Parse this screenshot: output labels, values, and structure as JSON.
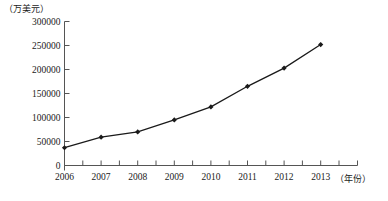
{
  "chart_data": {
    "type": "line",
    "title": "",
    "xlabel": "(年份)",
    "ylabel": "(万美元)",
    "categories": [
      "2006",
      "2007",
      "2008",
      "2009",
      "2010",
      "2011",
      "2012",
      "2013"
    ],
    "values": [
      37000,
      59000,
      70000,
      95000,
      122000,
      165000,
      203000,
      252000
    ],
    "series": [
      {
        "name": "",
        "values": [
          37000,
          59000,
          70000,
          95000,
          122000,
          165000,
          203000,
          252000
        ]
      }
    ],
    "ylim": [
      0,
      300000
    ],
    "ytick_labels": [
      "0",
      "50000",
      "100000",
      "150000",
      "200000",
      "250000",
      "300000"
    ],
    "ytick_values": [
      0,
      50000,
      100000,
      150000,
      200000,
      250000,
      300000
    ],
    "xtick_labels": [
      "2006",
      "2007",
      "2008",
      "2009",
      "2010",
      "2011",
      "2012",
      "2013"
    ],
    "grid": false,
    "legend": "none",
    "line_color": "#1a1a1a",
    "marker": "diamond",
    "marker_color": "#1a1a1a",
    "axis_color": "#555555",
    "minor_ticks": true
  },
  "axis": {
    "y_unit": "（万美元）",
    "x_unit": "（年份）"
  }
}
